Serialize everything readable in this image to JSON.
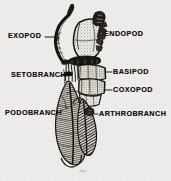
{
  "figure": {
    "kind": "scanned-line-engraving",
    "background_color": "#efeeec",
    "ink_color": "#17150f",
    "caption_text": "",
    "labels": [
      {
        "id": "exopod",
        "text": "EXOPOD",
        "x": 8,
        "y": 35,
        "leader": {
          "kind": "solid",
          "x1": 46,
          "y1": 37,
          "x2": 58,
          "y2": 37
        }
      },
      {
        "id": "endopod",
        "text": "ENDOPOD",
        "x": 104,
        "y": 33,
        "leader": {
          "kind": "dashed",
          "x1": 95,
          "y1": 40,
          "x2": 103,
          "y2": 35
        }
      },
      {
        "id": "setobranch",
        "text": "SETOBRANCH",
        "x": 12,
        "y": 74,
        "leader": {
          "kind": "solid",
          "x1": 61,
          "y1": 76,
          "x2": 70,
          "y2": 76
        }
      },
      {
        "id": "basipod",
        "text": "BASIPOD",
        "x": 113,
        "y": 70,
        "leader": {
          "kind": "solid",
          "x1": 106,
          "y1": 73,
          "x2": 112,
          "y2": 73
        }
      },
      {
        "id": "coxopod",
        "text": "COXOPOD",
        "x": 113,
        "y": 88,
        "leader": {
          "kind": "solid",
          "x1": 105,
          "y1": 91,
          "x2": 112,
          "y2": 91
        }
      },
      {
        "id": "podobranch",
        "text": "PODOBRANCH",
        "x": 6,
        "y": 115,
        "leader": {
          "kind": "dashed",
          "x1": 58,
          "y1": 112,
          "x2": 78,
          "y2": 103
        }
      },
      {
        "id": "arthrobranch",
        "text": "ARTHROBRANCH",
        "x": 99,
        "y": 115,
        "leader": {
          "kind": "solid",
          "x1": 90,
          "y1": 114,
          "x2": 98,
          "y2": 114
        }
      }
    ],
    "structures": [
      {
        "id": "exopod-flagellum",
        "label": "EXOPOD"
      },
      {
        "id": "endopod-segments",
        "label": "ENDOPOD"
      },
      {
        "id": "setobranch-tuft",
        "label": "SETOBRANCH"
      },
      {
        "id": "basipod-segment",
        "label": "BASIPOD"
      },
      {
        "id": "coxopod-segment",
        "label": "COXOPOD"
      },
      {
        "id": "podobranch-gill",
        "label": "PODOBRANCH"
      },
      {
        "id": "arthrobranch-gill",
        "label": "ARTHROBRANCH"
      }
    ]
  }
}
